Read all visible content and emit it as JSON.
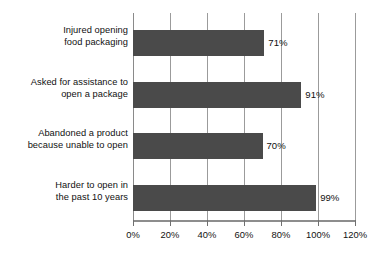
{
  "chart_data": {
    "type": "bar",
    "orientation": "horizontal",
    "title": "",
    "subtitle": "",
    "xlabel": "",
    "ylabel": "",
    "xlim": [
      0,
      120
    ],
    "grid": true,
    "legend": null,
    "categories": [
      "Injured opening food packaging",
      "Asked for assistance to open a package",
      "Abandoned a product because unable to open",
      "Harder to open in the past 10 years"
    ],
    "category_lines": [
      [
        "Injured opening",
        "food packaging"
      ],
      [
        "Asked for assistance to",
        "open a package"
      ],
      [
        "Abandoned a product",
        "because unable to open"
      ],
      [
        "Harder to open in",
        "the past 10 years"
      ]
    ],
    "values": [
      71,
      91,
      70,
      99
    ],
    "value_labels": [
      "71%",
      "91%",
      "70%",
      "99%"
    ],
    "xticks": [
      0,
      20,
      40,
      60,
      80,
      100,
      120
    ],
    "xtick_labels": [
      "0%",
      "20%",
      "40%",
      "60%",
      "80%",
      "100%",
      "120%"
    ],
    "colors": {
      "bar": "#4a4a4a",
      "gridline": "#9b9b9b",
      "axis": "#8d8d8d",
      "text": "#111111",
      "background": "#ffffff"
    }
  }
}
